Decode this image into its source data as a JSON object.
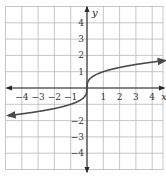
{
  "chart_data": {
    "type": "line",
    "title": "",
    "function": "y = cube root of x",
    "xlabel": "x",
    "ylabel": "y",
    "xlim": [
      -5,
      4.7
    ],
    "ylim": [
      -5,
      5
    ],
    "grid": true,
    "x_tick_labels": [
      "−4",
      "−3",
      "−2",
      "−1",
      "1",
      "2",
      "3",
      "4"
    ],
    "y_tick_labels": [
      "4",
      "3",
      "2",
      "1",
      "−2",
      "−3",
      "−4"
    ],
    "series": [
      {
        "name": "cube root",
        "x": [
          -4.8,
          -4,
          -3,
          -2,
          -1,
          -0.5,
          -0.125,
          0,
          0.125,
          0.5,
          1,
          2,
          3,
          4,
          4.8
        ],
        "y": [
          -1.69,
          -1.59,
          -1.44,
          -1.26,
          -1.0,
          -0.79,
          -0.5,
          0,
          0.5,
          0.79,
          1.0,
          1.26,
          1.44,
          1.59,
          1.69
        ],
        "arrows": "both ends"
      }
    ]
  },
  "labels": {
    "x_axis": "x",
    "y_axis": "y"
  },
  "colors": {
    "grid": "#b8b8b8",
    "axis": "#2a2a2a",
    "curve": "#4a4a4a"
  }
}
